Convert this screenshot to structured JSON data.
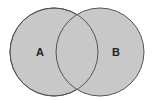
{
  "diagram": {
    "type": "venn",
    "sets": [
      {
        "label": "A",
        "cx": 54,
        "cy": 52,
        "r": 44
      },
      {
        "label": "B",
        "cx": 100,
        "cy": 52,
        "r": 44
      }
    ],
    "colors": {
      "fill": "#c8c8c8",
      "stroke": "#555555",
      "label": "#222222",
      "background": "#ffffff"
    }
  }
}
